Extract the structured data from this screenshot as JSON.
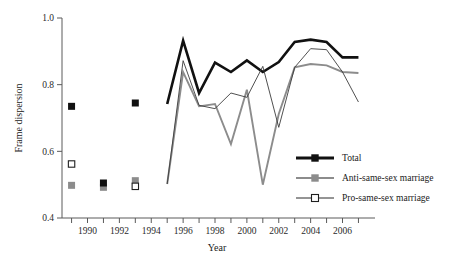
{
  "chart_data": {
    "type": "line",
    "title": "",
    "xlabel": "Year",
    "ylabel": "Frame dispersion",
    "xlim": [
      1988.4,
      2007.6
    ],
    "ylim": [
      0.4,
      1.0
    ],
    "grid": false,
    "legend_position": "inside-right-lower",
    "y_ticks": [
      0.4,
      0.6,
      0.8,
      1.0
    ],
    "y_tick_labels": [
      "0.4",
      "0.6",
      "0.8",
      "1.0"
    ],
    "y_minor_ticks": [
      0.5,
      0.7,
      0.9
    ],
    "x_ticks": [
      1989,
      1990,
      1991,
      1992,
      1993,
      1994,
      1995,
      1996,
      1997,
      1998,
      1999,
      2000,
      2001,
      2002,
      2003,
      2004,
      2005,
      2006,
      2007
    ],
    "x_tick_labels": [
      "1990",
      "1992",
      "1994",
      "1996",
      "1998",
      "2000",
      "2002",
      "2004",
      "2006"
    ],
    "x_labeled_years": [
      1990,
      1992,
      1994,
      1996,
      1998,
      2000,
      2002,
      2004,
      2006
    ],
    "series": [
      {
        "name": "Total",
        "key": "total",
        "color": "#111111",
        "line_width": 2.6,
        "marker": "filled-square",
        "marker_years": [
          1989,
          1991,
          1993
        ],
        "marker_values": [
          0.735,
          0.505,
          0.745
        ],
        "x": [
          1995,
          1996,
          1997,
          1998,
          1999,
          2000,
          2001,
          2002,
          2003,
          2004,
          2005,
          2006,
          2007
        ],
        "values": [
          0.742,
          0.932,
          0.775,
          0.866,
          0.838,
          0.873,
          0.838,
          0.868,
          0.928,
          0.935,
          0.928,
          0.882,
          0.882
        ]
      },
      {
        "name": "Anti-same-sex marriage",
        "key": "anti",
        "color": "#8c8c8c",
        "line_width": 1.9,
        "marker": "filled-square-gray",
        "marker_years": [
          1989,
          1991,
          1993
        ],
        "marker_values": [
          0.498,
          0.492,
          0.512
        ],
        "x": [
          1995,
          1996,
          1997,
          1998,
          1999,
          2000,
          2001,
          2002,
          2003,
          2004,
          2005,
          2006,
          2007
        ],
        "values": [
          0.502,
          0.838,
          0.735,
          0.742,
          0.622,
          0.785,
          0.5,
          0.712,
          0.852,
          0.862,
          0.858,
          0.838,
          0.835
        ]
      },
      {
        "name": "Pro-same-sex marriage",
        "key": "pro",
        "color": "#3c3c3c",
        "line_width": 0.9,
        "marker": "open-square",
        "marker_years": [
          1989,
          1993
        ],
        "marker_values": [
          0.562,
          0.495
        ],
        "x": [
          1995,
          1996,
          1997,
          1998,
          1999,
          2000,
          2001,
          2002,
          2003,
          2004,
          2005,
          2006,
          2007
        ],
        "values": [
          0.502,
          0.872,
          0.738,
          0.728,
          0.775,
          0.762,
          0.855,
          0.672,
          0.852,
          0.908,
          0.905,
          0.838,
          0.748
        ]
      }
    ],
    "legend_entries": [
      {
        "label": "Total",
        "color": "#111111",
        "marker": "filled-square",
        "line_width": 2.8
      },
      {
        "label": "Anti-same-sex marriage",
        "color": "#8c8c8c",
        "marker": "filled-square-gray",
        "line_width": 2.0
      },
      {
        "label": "Pro-same-sex marriage",
        "color": "#2a2a2a",
        "marker": "open-square",
        "line_width": 1.0
      }
    ]
  }
}
